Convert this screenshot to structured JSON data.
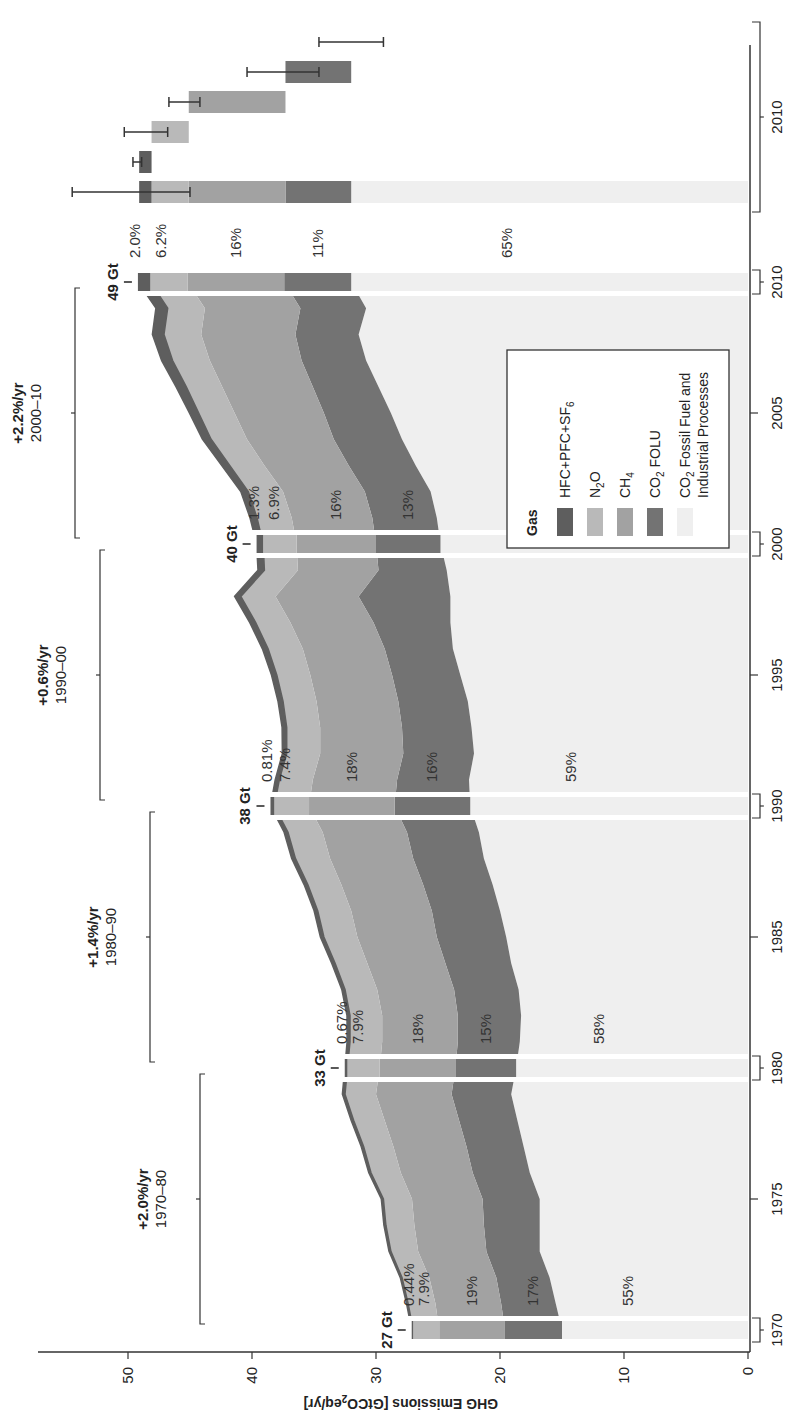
{
  "chart_data": {
    "type": "area",
    "orientation": "rotated 90° counter-clockwise (years run bottom-to-top, emissions run right-to-left)",
    "title": "",
    "xlabel": "",
    "ylabel": "GHG Emissions [GtCO2eq/yr]",
    "ylabel_parts": {
      "pre": "GHG Emissions [GtCO",
      "sub": "2",
      "post": "eq/yr]"
    },
    "ylim": [
      0,
      57
    ],
    "yticks": [
      0,
      10,
      20,
      30,
      40,
      50
    ],
    "xticks": [
      1970,
      1975,
      1980,
      1985,
      1990,
      1995,
      2000,
      2005,
      2010
    ],
    "extra_xtick": "2010",
    "grid": false,
    "legend_position": "inside, lower right of plot (upper-right in rotated view)",
    "legend": {
      "title": "Gas",
      "entries": [
        {
          "key": "fgas",
          "label": "HFC+PFC+SF",
          "sub": "6",
          "color": "#5e5e5e"
        },
        {
          "key": "n2o",
          "label": "N",
          "sub": "2",
          "post": "O",
          "color": "#b9b9b9"
        },
        {
          "key": "ch4",
          "label": "CH",
          "sub": "4",
          "color": "#a2a2a2"
        },
        {
          "key": "co2_folu",
          "label": "CO",
          "sub": "2",
          "post": " FOLU",
          "color": "#737373"
        },
        {
          "key": "co2_ff",
          "label": "CO",
          "sub": "2",
          "post": " Fossil Fuel and",
          "line2": "Industrial Processes",
          "color": "#efefef"
        }
      ]
    },
    "years": [
      1970,
      1971,
      1972,
      1973,
      1974,
      1975,
      1976,
      1977,
      1978,
      1979,
      1980,
      1981,
      1982,
      1983,
      1984,
      1985,
      1986,
      1987,
      1988,
      1989,
      1990,
      1991,
      1992,
      1993,
      1994,
      1995,
      1996,
      1997,
      1998,
      1999,
      2000,
      2001,
      2002,
      2003,
      2004,
      2005,
      2006,
      2007,
      2008,
      2009,
      2010
    ],
    "series": [
      {
        "name": "CO2 Fossil Fuel and Industrial Processes",
        "key": "co2_ff",
        "values": [
          15.0,
          15.5,
          16.0,
          16.8,
          16.8,
          16.8,
          17.6,
          18.1,
          18.6,
          19.1,
          18.7,
          18.4,
          18.3,
          18.5,
          19.1,
          19.5,
          20.0,
          20.6,
          21.3,
          21.7,
          22.4,
          22.5,
          22.1,
          22.3,
          22.6,
          23.2,
          23.8,
          24.0,
          24.0,
          24.3,
          24.8,
          25.1,
          25.6,
          26.8,
          27.9,
          28.8,
          29.8,
          30.8,
          31.4,
          30.8,
          32.0
        ]
      },
      {
        "name": "CO2 FOLU",
        "key": "co2_folu",
        "values": [
          4.6,
          4.4,
          4.3,
          4.3,
          4.5,
          4.6,
          4.6,
          4.6,
          4.7,
          4.8,
          4.9,
          5.0,
          5.1,
          5.2,
          5.3,
          5.6,
          5.5,
          5.6,
          5.7,
          5.8,
          6.1,
          5.8,
          5.7,
          5.6,
          5.6,
          5.5,
          5.5,
          6.2,
          7.4,
          5.5,
          5.2,
          5.2,
          5.3,
          5.4,
          5.5,
          5.4,
          5.3,
          5.2,
          5.1,
          5.3,
          5.4
        ]
      },
      {
        "name": "CH4",
        "key": "ch4",
        "values": [
          5.3,
          5.3,
          5.4,
          5.5,
          5.6,
          5.7,
          5.8,
          5.9,
          6.0,
          6.1,
          6.1,
          6.1,
          6.1,
          6.2,
          6.3,
          6.4,
          6.5,
          6.6,
          6.7,
          6.8,
          6.9,
          6.8,
          6.7,
          6.6,
          6.6,
          6.6,
          6.6,
          6.7,
          6.7,
          6.5,
          6.4,
          6.5,
          6.6,
          6.8,
          7.0,
          7.2,
          7.3,
          7.4,
          7.6,
          7.7,
          7.8
        ]
      },
      {
        "name": "N2O",
        "key": "n2o",
        "values": [
          2.1,
          2.2,
          2.2,
          2.2,
          2.3,
          2.3,
          2.4,
          2.4,
          2.5,
          2.5,
          2.6,
          2.6,
          2.6,
          2.6,
          2.6,
          2.7,
          2.7,
          2.7,
          2.8,
          2.8,
          2.8,
          2.7,
          2.7,
          2.7,
          2.7,
          2.7,
          2.8,
          2.8,
          2.8,
          2.7,
          2.7,
          2.8,
          2.8,
          2.8,
          2.9,
          2.9,
          2.9,
          3.0,
          3.0,
          3.0,
          3.0
        ]
      },
      {
        "name": "HFC+PFC+SF6",
        "key": "fgas",
        "values": [
          0.12,
          0.13,
          0.14,
          0.15,
          0.16,
          0.17,
          0.18,
          0.19,
          0.2,
          0.21,
          0.22,
          0.23,
          0.24,
          0.26,
          0.27,
          0.28,
          0.29,
          0.3,
          0.3,
          0.31,
          0.31,
          0.33,
          0.35,
          0.37,
          0.4,
          0.43,
          0.46,
          0.48,
          0.5,
          0.52,
          0.53,
          0.56,
          0.6,
          0.65,
          0.7,
          0.75,
          0.82,
          0.88,
          0.93,
          0.95,
          1.0
        ]
      }
    ],
    "snapshots": [
      {
        "year": 1970,
        "total_label": "27 Gt",
        "total": 27,
        "shares": {
          "fgas": "0.44%",
          "n2o": "7.9%",
          "ch4": "19%",
          "co2_folu": "17%",
          "co2_ff": "55%"
        }
      },
      {
        "year": 1980,
        "total_label": "33 Gt",
        "total": 33,
        "shares": {
          "fgas": "0.67%",
          "n2o": "7.9%",
          "ch4": "18%",
          "co2_folu": "15%",
          "co2_ff": "58%"
        }
      },
      {
        "year": 1990,
        "total_label": "38 Gt",
        "total": 38,
        "shares": {
          "fgas": "0.81%",
          "n2o": "7.4%",
          "ch4": "18%",
          "co2_folu": "16%",
          "co2_ff": "59%"
        }
      },
      {
        "year": 2000,
        "total_label": "40 Gt",
        "total": 40,
        "shares": {
          "fgas": "1.3%",
          "n2o": "6.9%",
          "ch4": "16%",
          "co2_folu": "13%",
          "co2_ff": "62%"
        }
      },
      {
        "year": 2010,
        "total_label": "49 Gt",
        "total": 49,
        "shares": {
          "fgas": "2.0%",
          "n2o": "6.2%",
          "ch4": "16%",
          "co2_folu": "11%",
          "co2_ff": "65%"
        }
      }
    ],
    "growth_rates": [
      {
        "rate": "+2.0%/yr",
        "period": "1970–80",
        "from": 1970,
        "to": 1980
      },
      {
        "rate": "+1.4%/yr",
        "period": "1980–90",
        "from": 1980,
        "to": 1990
      },
      {
        "rate": "+0.6%/yr",
        "period": "1990–00",
        "from": 1990,
        "to": 2000
      },
      {
        "rate": "+2.2%/yr",
        "period": "2000–10",
        "from": 2000,
        "to": 2010
      }
    ],
    "breakdown_2010": {
      "label": "2010",
      "description": "2010 total and per-gas waterfall bars with uncertainty ranges",
      "stack_total": {
        "from": 0,
        "to": 49,
        "err_low": 45,
        "err_high": 54.5
      },
      "bars": [
        {
          "key": "fgas",
          "from": 48.1,
          "to": 49.1,
          "err_low": 48.9,
          "err_high": 49.6
        },
        {
          "key": "n2o",
          "from": 45.1,
          "to": 48.1,
          "err_low": 46.8,
          "err_high": 50.3
        },
        {
          "key": "ch4",
          "from": 37.3,
          "to": 45.1,
          "err_low": 44.2,
          "err_high": 46.7
        },
        {
          "key": "co2_folu",
          "from": 32.0,
          "to": 37.3,
          "err_low": 34.6,
          "err_high": 40.4
        },
        {
          "key": "co2_ff",
          "from": 0,
          "to": 32.0,
          "err_low": 29.4,
          "err_high": 34.6
        }
      ]
    }
  },
  "axis": {
    "ytick_labels": [
      "0",
      "10",
      "20",
      "30",
      "40",
      "50"
    ],
    "xtick_labels": [
      "1970",
      "1975",
      "1980",
      "1985",
      "1990",
      "1995",
      "2000",
      "2005",
      "2010"
    ],
    "extra_xtick_label": "2010"
  },
  "colors": {
    "fgas": "#5e5e5e",
    "n2o": "#b9b9b9",
    "ch4": "#a2a2a2",
    "co2_folu": "#737373",
    "co2_ff": "#efefef",
    "axis": "#333333",
    "text": "#222222"
  }
}
